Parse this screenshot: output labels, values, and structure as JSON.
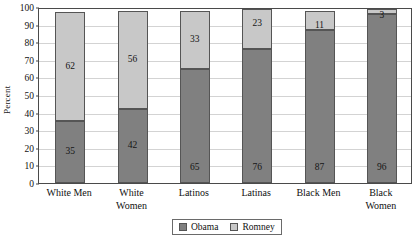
{
  "chart_data": {
    "type": "bar",
    "bar_mode": "stacked",
    "title": "",
    "xlabel": "",
    "ylabel": "Percent",
    "ylim": [
      0,
      100
    ],
    "yticks": [
      0,
      10,
      20,
      30,
      40,
      50,
      60,
      70,
      80,
      90,
      100
    ],
    "grid": true,
    "legend_position": "bottom-center",
    "categories": [
      "White Men",
      "White Women",
      "Latinos",
      "Latinas",
      "Black Men",
      "Black Women"
    ],
    "category_lines": [
      [
        "White Men"
      ],
      [
        "White",
        "Women"
      ],
      [
        "Latinos"
      ],
      [
        "Latinas"
      ],
      [
        "Black Men"
      ],
      [
        "Black",
        "Women"
      ]
    ],
    "series": [
      {
        "name": "Obama",
        "color": "#808080",
        "values": [
          35,
          42,
          65,
          76,
          87,
          96
        ]
      },
      {
        "name": "Romney",
        "color": "#c8c8c8",
        "values": [
          62,
          56,
          33,
          23,
          11,
          3
        ]
      }
    ]
  },
  "legend": {
    "items": [
      {
        "label": "Obama",
        "swatch": "obama"
      },
      {
        "label": "Romney",
        "swatch": "romney"
      }
    ]
  }
}
